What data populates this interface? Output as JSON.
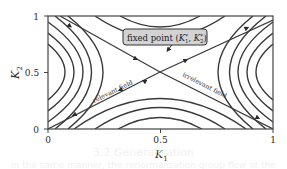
{
  "figure": {
    "type": "rg-flow-diagram",
    "x_axis": {
      "label": "K",
      "label_sub": "1",
      "ticks": [
        "0",
        "0.5",
        "1"
      ],
      "range": [
        0,
        1
      ]
    },
    "y_axis": {
      "label": "K",
      "label_sub": "2",
      "ticks": [
        "0",
        "0.5",
        "1"
      ],
      "range": [
        0,
        1
      ]
    },
    "fixed_point": {
      "label_prefix": "fixed point (",
      "k1": "K",
      "k1_sub": "1",
      "k1_sup": "*",
      "separator": ", ",
      "k2": "K",
      "k2_sub": "2",
      "k2_sup": "*",
      "label_suffix": ")",
      "position": [
        0.5,
        0.5
      ],
      "box_fill": "#d3d3d3",
      "box_stroke": "#333333"
    },
    "annotations": {
      "relevant": "relevant field",
      "irrelevant": "irrelevant field"
    },
    "colors": {
      "line": "#3a3a3a",
      "frame": "#444444",
      "background": "#ffffff"
    }
  },
  "background_bleed": {
    "line1": "3.2 Generalisation",
    "line2": "in the same manner, the renormalisation group flow at the fixed point"
  }
}
